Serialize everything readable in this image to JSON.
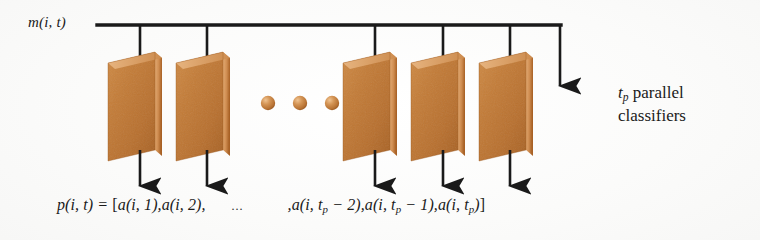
{
  "figure": {
    "kind": "block-diagram",
    "background_color": "#fcfcfc",
    "ink_color": "#1a1a1a",
    "slab_color": "#c17a38",
    "slab_edge_color": "#e0a368",
    "slab_shadow_color": "#8d5424",
    "dot_color": "#c98b46"
  },
  "input": {
    "signal_label": "m(i, t)"
  },
  "annotation": {
    "tp_symbol": "t",
    "tp_subscript": "p",
    "line1_rest": " parallel",
    "line2": "classifiers"
  },
  "output_equation": {
    "lhs": "p(i, t) = ",
    "open_bracket": "[",
    "term1": "a(i, 1),",
    "term2": "a(i, 2),",
    "ellipsis": "...",
    "comma_before_tail": ",",
    "term_n2_prefix": "a(i, t",
    "term_n2_sub": "p",
    "term_n2_suffix": " − 2),",
    "term_n1_prefix": "a(i, t",
    "term_n1_sub": "p",
    "term_n1_suffix": " − 1),",
    "term_n_prefix": "a(i, t",
    "term_n_sub": "p",
    "term_n_suffix": ")",
    "close_bracket": "]"
  },
  "classifiers": [
    {
      "name": "classifier-1",
      "x": 108,
      "arrow_x": 140
    },
    {
      "name": "classifier-2",
      "x": 176,
      "arrow_x": 207
    },
    {
      "name": "classifier-n-2",
      "x": 343,
      "arrow_x": 375
    },
    {
      "name": "classifier-n-1",
      "x": 411,
      "arrow_x": 443
    },
    {
      "name": "classifier-n",
      "x": 479,
      "arrow_x": 510
    }
  ],
  "ellipsis_dots": [
    {
      "cx": 268,
      "cy": 103
    },
    {
      "cx": 300,
      "cy": 103
    },
    {
      "cx": 332,
      "cy": 103
    }
  ],
  "bus": {
    "y": 25,
    "x_start": 97,
    "x_end": 560,
    "terminus_arrow_x": 560
  }
}
